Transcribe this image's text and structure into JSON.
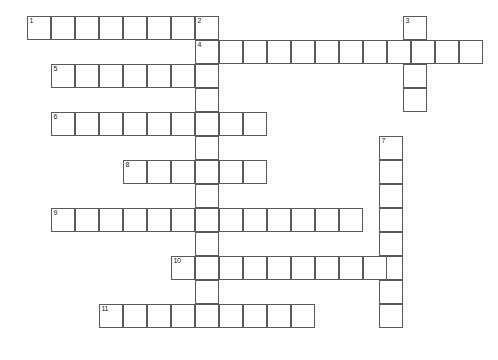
{
  "puzzle": {
    "title": "Crossword Puzzle Grid",
    "cell_size": 24,
    "grid_colors": {
      "cell_fill": "#ffffff",
      "cell_border": "#5a5a5a",
      "number_color": "#1a1a1a",
      "background": "#ffffff"
    },
    "entries": [
      {
        "number": "1",
        "direction": "across",
        "x": 27,
        "y": 16,
        "length": 8
      },
      {
        "number": "2",
        "direction": "down",
        "x": 195,
        "y": 16,
        "length": 13
      },
      {
        "number": "3",
        "direction": "down",
        "x": 403,
        "y": 16,
        "length": 4
      },
      {
        "number": "4",
        "direction": "across",
        "x": 195,
        "y": 40,
        "length": 12
      },
      {
        "number": "5",
        "direction": "across",
        "x": 51,
        "y": 64,
        "length": 7
      },
      {
        "number": "6",
        "direction": "across",
        "x": 51,
        "y": 112,
        "length": 9
      },
      {
        "number": "7",
        "direction": "down",
        "x": 379,
        "y": 136,
        "length": 8
      },
      {
        "number": "8",
        "direction": "across",
        "x": 123,
        "y": 160,
        "length": 6
      },
      {
        "number": "9",
        "direction": "across",
        "x": 51,
        "y": 208,
        "length": 13
      },
      {
        "number": "10",
        "direction": "across",
        "x": 171,
        "y": 256,
        "length": 9
      },
      {
        "number": "11",
        "direction": "across",
        "x": 99,
        "y": 304,
        "length": 9
      }
    ],
    "numbered_cells": [
      {
        "label": "1",
        "x": 27,
        "y": 16
      },
      {
        "label": "2",
        "x": 195,
        "y": 16
      },
      {
        "label": "3",
        "x": 403,
        "y": 16
      },
      {
        "label": "4",
        "x": 195,
        "y": 40
      },
      {
        "label": "5",
        "x": 51,
        "y": 64
      },
      {
        "label": "6",
        "x": 51,
        "y": 112
      },
      {
        "label": "7",
        "x": 379,
        "y": 136
      },
      {
        "label": "8",
        "x": 123,
        "y": 160
      },
      {
        "label": "9",
        "x": 51,
        "y": 208
      },
      {
        "label": "10",
        "x": 171,
        "y": 256
      },
      {
        "label": "11",
        "x": 99,
        "y": 304
      }
    ]
  }
}
